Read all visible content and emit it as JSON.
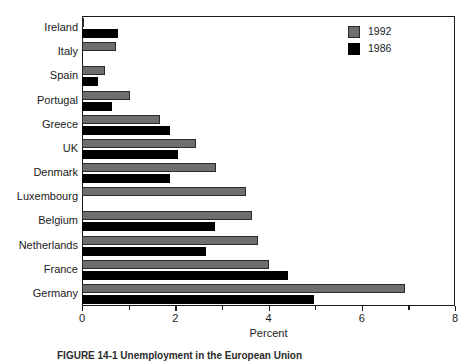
{
  "chart_data": {
    "type": "bar",
    "orientation": "horizontal",
    "title": "",
    "xlabel": "Percent",
    "ylabel": "",
    "xlim": [
      0,
      8
    ],
    "xticks": [
      0,
      2,
      4,
      6,
      8
    ],
    "xticklabels": [
      "0",
      "2",
      "4",
      "6",
      "8"
    ],
    "grid": false,
    "legend_position": "top-right",
    "categories": [
      "Ireland",
      "Italy",
      "Spain",
      "Portugal",
      "Greece",
      "UK",
      "Denmark",
      "Luxembourg",
      "Belgium",
      "Netherlands",
      "France",
      "Germany"
    ],
    "series": [
      {
        "name": "1992",
        "color": "#6e6e6e",
        "values": [
          0.05,
          0.73,
          0.5,
          1.03,
          1.67,
          2.45,
          2.87,
          3.52,
          3.65,
          3.78,
          4.0,
          6.93
        ]
      },
      {
        "name": "1986",
        "color": "#000000",
        "values": [
          0.77,
          0.0,
          0.35,
          0.65,
          1.88,
          2.05,
          1.88,
          0.0,
          2.85,
          2.67,
          4.42,
          4.98
        ]
      }
    ]
  },
  "legend": {
    "entries": [
      {
        "label": "1992",
        "swatch": "sw-1992"
      },
      {
        "label": "1986",
        "swatch": "sw-1986"
      }
    ]
  },
  "caption": {
    "text": "FIGURE 14-1 Unemployment in the European Union"
  }
}
